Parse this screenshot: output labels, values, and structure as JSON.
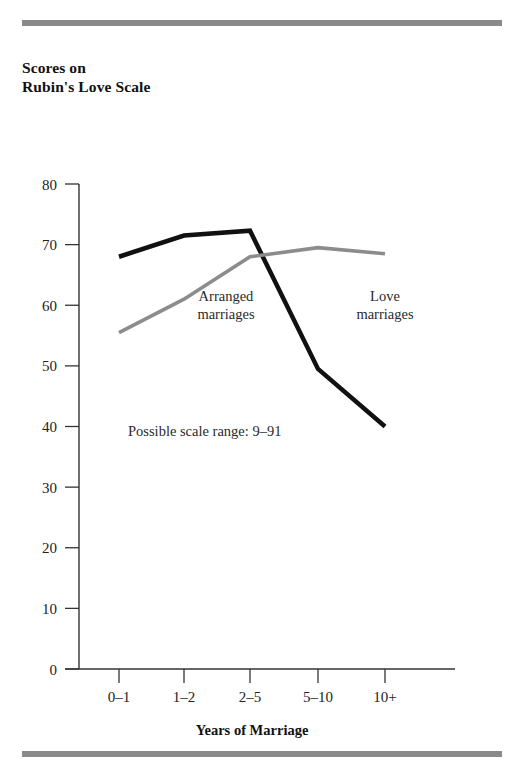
{
  "figure": {
    "title": "Scores on\nRubin's Love Scale",
    "scale_note": "Possible scale range: 9–91",
    "rule_color": "#8a8a8a"
  },
  "annotations": {
    "arranged": "Arranged\nmarriages",
    "love": "Love\nmarriages"
  },
  "chart_data": {
    "type": "line",
    "title": "Scores on Rubin's Love Scale",
    "xlabel": "Years of Marriage",
    "ylabel": "Scores on Rubin's Love Scale",
    "categories": [
      "0–1",
      "1–2",
      "2–5",
      "5–10",
      "10+"
    ],
    "ylim": [
      0,
      80
    ],
    "yticks": [
      0,
      10,
      20,
      30,
      40,
      50,
      60,
      70,
      80
    ],
    "ytick_labels": [
      "0",
      "10",
      "20",
      "30",
      "40",
      "50",
      "60",
      "70",
      "80"
    ],
    "grid": false,
    "legend": "inline-annotations",
    "annotations": [
      "Arranged marriages",
      "Love marriages",
      "Possible scale range: 9–91"
    ],
    "series": [
      {
        "name": "Love marriages",
        "color": "#111111",
        "width": 4.5,
        "values": [
          68.0,
          71.5,
          72.3,
          49.5,
          40.0
        ]
      },
      {
        "name": "Arranged marriages",
        "color": "#8c8c8c",
        "width": 3.6,
        "values": [
          55.5,
          61.0,
          68.0,
          69.5,
          68.5
        ]
      }
    ]
  }
}
